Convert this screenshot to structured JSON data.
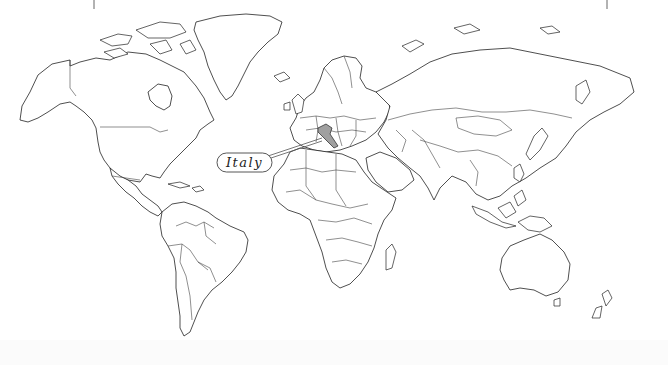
{
  "map": {
    "type": "world-political-outline",
    "highlighted_country": {
      "name": "Italy",
      "fill_color": "#a0a0a0"
    },
    "callout": {
      "label": "Italy"
    },
    "colors": {
      "land_fill": "#ffffff",
      "border_stroke": "#222222",
      "background": "#ffffff"
    }
  }
}
